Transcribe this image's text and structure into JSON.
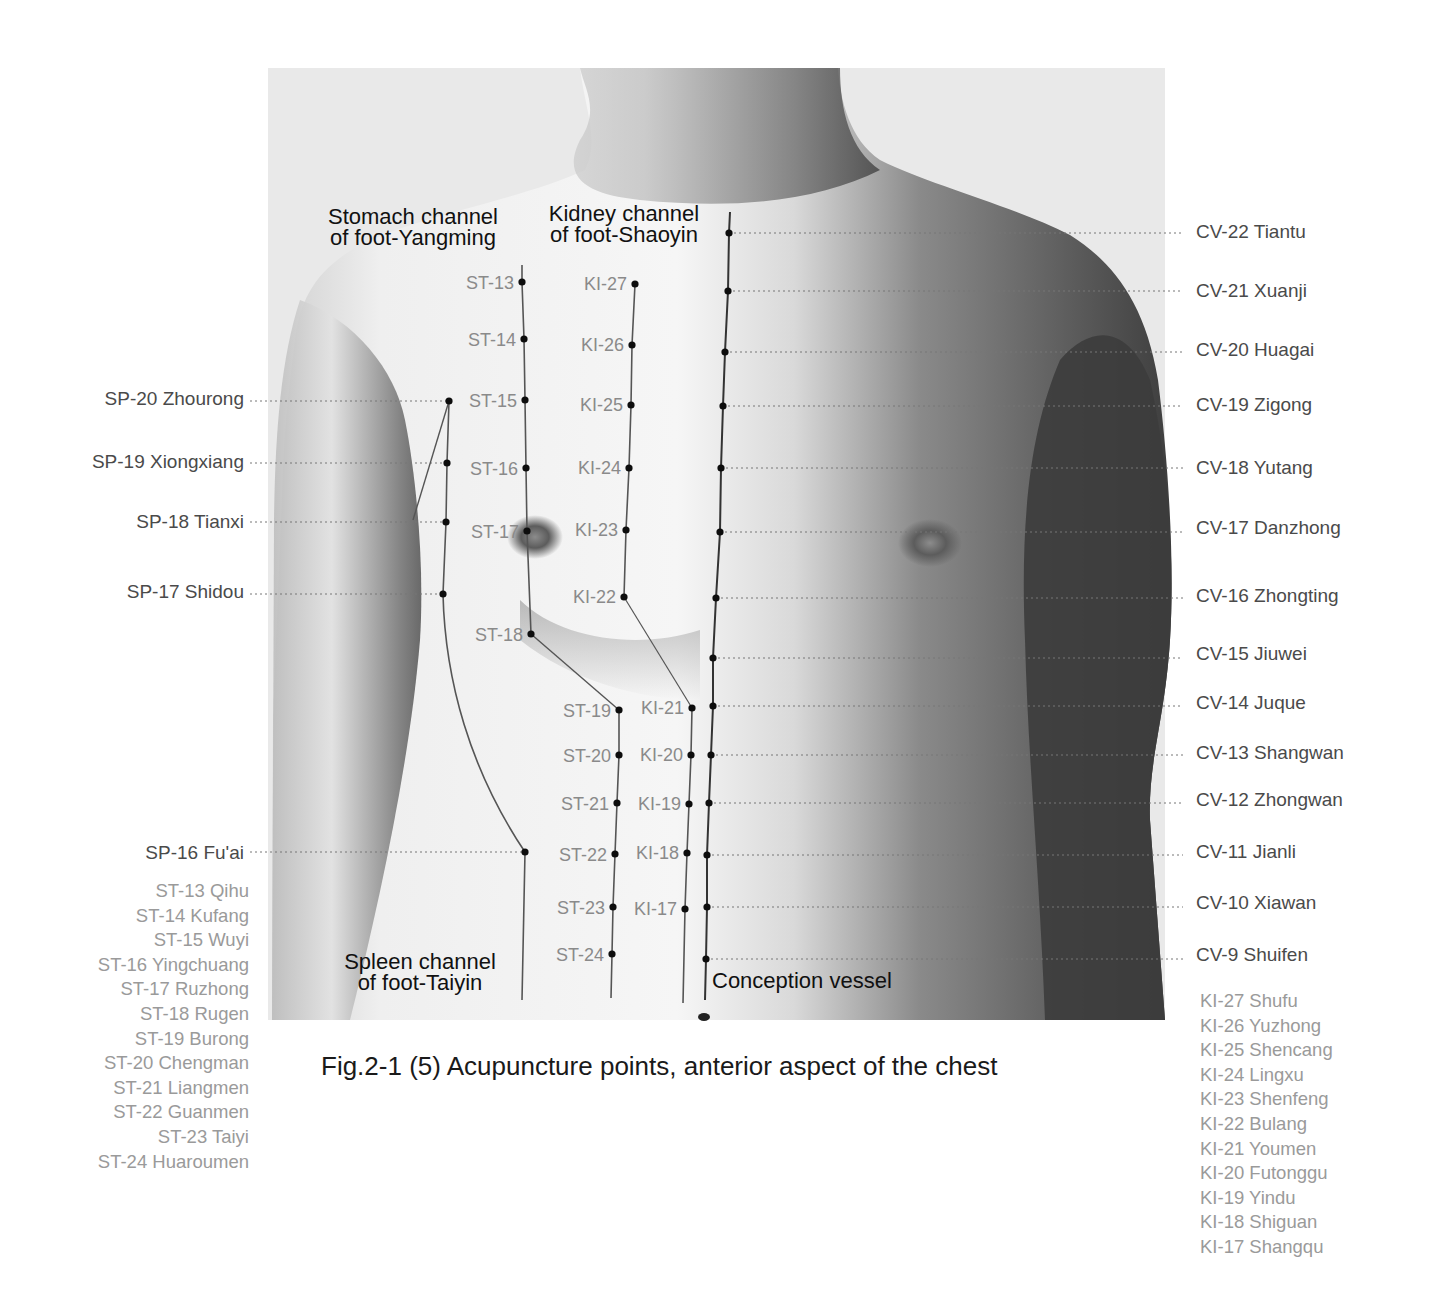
{
  "figure": {
    "caption": "Fig.2-1 (5) Acupuncture points, anterior aspect of the chest",
    "photo_frame": {
      "x": 268,
      "y": 68,
      "w": 897,
      "h": 952,
      "bg": "#e9e9e9"
    },
    "channel_titles": {
      "stomach": [
        "Stomach channel",
        "of foot-Yangming"
      ],
      "kidney": [
        "Kidney channel",
        "of foot-Shaoyin"
      ],
      "spleen": [
        "Spleen channel",
        "of foot-Taiyin"
      ],
      "conception": "Conception vessel"
    }
  },
  "spleen_points": [
    {
      "label": "SP-20 Zhourong",
      "dot": [
        449,
        401
      ],
      "ly": 399
    },
    {
      "label": "SP-19 Xiongxiang",
      "dot": [
        447,
        463
      ],
      "ly": 462
    },
    {
      "label": "SP-18 Tianxi",
      "dot": [
        446,
        522
      ],
      "ly": 522
    },
    {
      "label": "SP-17 Shidou",
      "dot": [
        443,
        594
      ],
      "ly": 592
    },
    {
      "label": "SP-16 Fu'ai",
      "dot": [
        525,
        852
      ],
      "ly": 853
    }
  ],
  "stomach_points": [
    {
      "label": "ST-13",
      "dot": [
        522,
        282
      ]
    },
    {
      "label": "ST-14",
      "dot": [
        524,
        339
      ]
    },
    {
      "label": "ST-15",
      "dot": [
        525,
        400
      ]
    },
    {
      "label": "ST-16",
      "dot": [
        526,
        468
      ]
    },
    {
      "label": "ST-17",
      "dot": [
        527,
        531
      ]
    },
    {
      "label": "ST-18",
      "dot": [
        531,
        634
      ]
    },
    {
      "label": "ST-19",
      "dot": [
        619,
        710
      ]
    },
    {
      "label": "ST-20",
      "dot": [
        619,
        755
      ]
    },
    {
      "label": "ST-21",
      "dot": [
        617,
        803
      ]
    },
    {
      "label": "ST-22",
      "dot": [
        615,
        854
      ]
    },
    {
      "label": "ST-23",
      "dot": [
        613,
        907
      ]
    },
    {
      "label": "ST-24",
      "dot": [
        612,
        954
      ]
    }
  ],
  "kidney_points": [
    {
      "label": "KI-27",
      "dot": [
        635,
        284
      ]
    },
    {
      "label": "KI-26",
      "dot": [
        632,
        345
      ]
    },
    {
      "label": "KI-25",
      "dot": [
        631,
        405
      ]
    },
    {
      "label": "KI-24",
      "dot": [
        629,
        468
      ]
    },
    {
      "label": "KI-23",
      "dot": [
        626,
        530
      ]
    },
    {
      "label": "KI-22",
      "dot": [
        624,
        597
      ]
    },
    {
      "label": "KI-21",
      "dot": [
        692,
        708
      ]
    },
    {
      "label": "KI-20",
      "dot": [
        691,
        755
      ]
    },
    {
      "label": "KI-19",
      "dot": [
        689,
        804
      ]
    },
    {
      "label": "KI-18",
      "dot": [
        687,
        853
      ]
    },
    {
      "label": "KI-17",
      "dot": [
        685,
        909
      ]
    }
  ],
  "conception_points": [
    {
      "label": "CV-22 Tiantu",
      "dot": [
        729,
        233
      ],
      "ly": 232
    },
    {
      "label": "CV-21 Xuanji",
      "dot": [
        728,
        291
      ],
      "ly": 291
    },
    {
      "label": "CV-20 Huagai",
      "dot": [
        725,
        352
      ],
      "ly": 350
    },
    {
      "label": "CV-19 Zigong",
      "dot": [
        723,
        406
      ],
      "ly": 405
    },
    {
      "label": "CV-18 Yutang",
      "dot": [
        721,
        468
      ],
      "ly": 468
    },
    {
      "label": "CV-17 Danzhong",
      "dot": [
        720,
        532
      ],
      "ly": 528
    },
    {
      "label": "CV-16 Zhongting",
      "dot": [
        716,
        598
      ],
      "ly": 596
    },
    {
      "label": "CV-15 Jiuwei",
      "dot": [
        713,
        658
      ],
      "ly": 654
    },
    {
      "label": "CV-14 Juque",
      "dot": [
        713,
        706
      ],
      "ly": 703
    },
    {
      "label": "CV-13 Shangwan",
      "dot": [
        711,
        755
      ],
      "ly": 753
    },
    {
      "label": "CV-12 Zhongwan",
      "dot": [
        709,
        803
      ],
      "ly": 800
    },
    {
      "label": "CV-11 Jianli",
      "dot": [
        707,
        855
      ],
      "ly": 852
    },
    {
      "label": "CV-10 Xiawan",
      "dot": [
        707,
        907
      ],
      "ly": 903
    },
    {
      "label": "CV-9 Shuifen",
      "dot": [
        706,
        959
      ],
      "ly": 955
    }
  ],
  "stomach_legend": [
    "ST-13 Qihu",
    "ST-14 Kufang",
    "ST-15 Wuyi",
    "ST-16 Yingchuang",
    "ST-17 Ruzhong",
    "ST-18 Rugen",
    "ST-19 Burong",
    "ST-20 Chengman",
    "ST-21 Liangmen",
    "ST-22 Guanmen",
    "ST-23 Taiyi",
    "ST-24 Huaroumen"
  ],
  "kidney_legend": [
    "KI-27 Shufu",
    "KI-26 Yuzhong",
    "KI-25 Shencang",
    "KI-24 Lingxu",
    "KI-23 Shenfeng",
    "KI-22 Bulang",
    "KI-21 Youmen",
    "KI-20 Futonggu",
    "KI-19 Yindu",
    "KI-18 Shiguan",
    "KI-17 Shangqu"
  ],
  "colors": {
    "dot": "#0d0d0d",
    "channel_line": "#555555",
    "leader": "#777777",
    "skin_light": "#f2f2f2",
    "skin_shadow": "#4a4a4a"
  }
}
